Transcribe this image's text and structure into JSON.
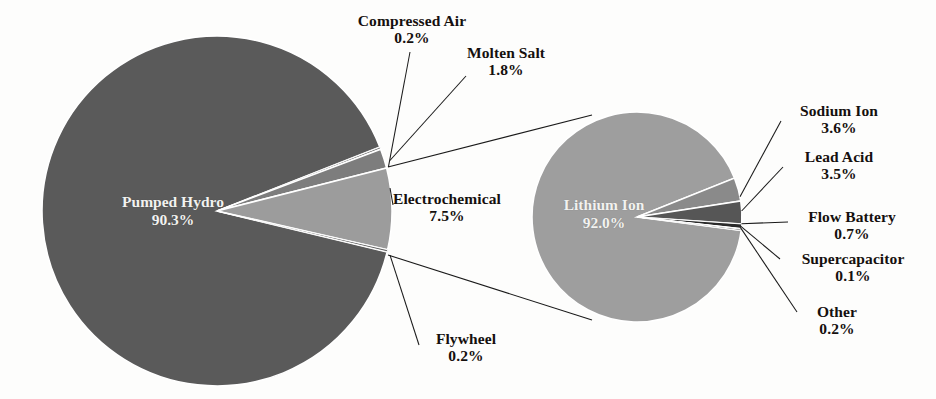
{
  "chart_data": {
    "type": "pie",
    "variant": "pie-of-pie",
    "title": "",
    "subtitle": "",
    "xlabel": "",
    "ylabel": "",
    "legend": "none",
    "grid": false,
    "primary": {
      "name": "Global Energy Storage Capacity",
      "center": [
        217,
        211
      ],
      "radius": 175,
      "labels": [
        "Pumped Hydro",
        "Compressed Air",
        "Molten Salt",
        "Electrochemical",
        "Flywheel"
      ],
      "values": [
        90.3,
        0.2,
        1.8,
        7.5,
        0.2
      ],
      "value_strings": [
        "90.3%",
        "0.2%",
        "1.8%",
        "7.5%",
        "0.2%"
      ],
      "colors": [
        "#5a5a5a",
        "#6e6e6e",
        "#7d7d7d",
        "#9c9c9c",
        "#6a6a6a"
      ],
      "exploded_slice": "Electrochemical"
    },
    "secondary": {
      "name": "Electrochemical Breakdown",
      "center": [
        637,
        217
      ],
      "radius": 105,
      "labels": [
        "Lithium Ion",
        "Sodium Ion",
        "Lead Acid",
        "Flow Battery",
        "Supercapacitor",
        "Other"
      ],
      "values": [
        92.0,
        3.6,
        3.5,
        0.7,
        0.1,
        0.2
      ],
      "value_strings": [
        "92.0%",
        "3.6%",
        "3.5%",
        "0.7%",
        "0.1%",
        "0.2%"
      ],
      "colors": [
        "#9e9e9e",
        "#8a8a8a",
        "#565656",
        "#2a2a2a",
        "#efefef",
        "#3a3a3a"
      ]
    },
    "palette": {
      "background": "#fdfdfc",
      "slice_border": "#ffffff",
      "leader_line": "#1a1a1a",
      "label_text": "#15100e",
      "inner_label_text": "#f2f2f0"
    }
  },
  "labels": {
    "pumped_hydro": {
      "cat": "Pumped Hydro",
      "pct": "90.3%"
    },
    "compressed_air": {
      "cat": "Compressed Air",
      "pct": "0.2%"
    },
    "molten_salt": {
      "cat": "Molten Salt",
      "pct": "1.8%"
    },
    "electrochemical": {
      "cat": "Electrochemical",
      "pct": "7.5%"
    },
    "flywheel": {
      "cat": "Flywheel",
      "pct": "0.2%"
    },
    "lithium_ion": {
      "cat": "Lithium Ion",
      "pct": "92.0%"
    },
    "sodium_ion": {
      "cat": "Sodium Ion",
      "pct": "3.6%"
    },
    "lead_acid": {
      "cat": "Lead Acid",
      "pct": "3.5%"
    },
    "flow_battery": {
      "cat": "Flow Battery",
      "pct": "0.7%"
    },
    "supercapacitor": {
      "cat": "Supercapacitor",
      "pct": "0.1%"
    },
    "other": {
      "cat": "Other",
      "pct": "0.2%"
    }
  }
}
